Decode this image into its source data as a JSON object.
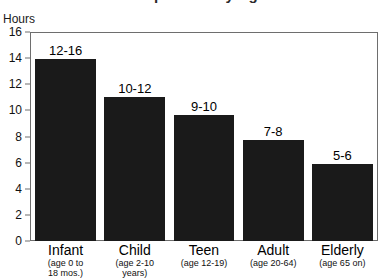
{
  "chart_data": {
    "type": "bar",
    "title": "Sleep Needs by Age",
    "title_clipped": true,
    "ylabel": "Hours",
    "xlabel": "",
    "ylim": [
      0,
      16
    ],
    "yticks": [
      0,
      2,
      4,
      6,
      8,
      10,
      12,
      14,
      16
    ],
    "grid": false,
    "legend": "none",
    "categories": [
      "Infant",
      "Child",
      "Teen",
      "Adult",
      "Elderly"
    ],
    "category_sublabels": [
      [
        "(age 0 to",
        "18 mos.)"
      ],
      [
        "(age 2-10",
        "years)"
      ],
      [
        "(age 12-19)"
      ],
      [
        "(age 20-64)"
      ],
      [
        "(age 65 on)"
      ]
    ],
    "values": [
      14.0,
      11.1,
      9.7,
      7.8,
      5.9
    ],
    "data_labels": [
      "12-16",
      "10-12",
      "9-10",
      "7-8",
      "5-6"
    ],
    "bar_color": "#1a1a1a",
    "frame_color": "#6e6e6e",
    "background": "#ffffff"
  },
  "axis": {
    "y_title": "Hours",
    "y_tick_labels": [
      "16",
      "14",
      "12",
      "10",
      "8",
      "6",
      "4",
      "2",
      "0"
    ]
  }
}
